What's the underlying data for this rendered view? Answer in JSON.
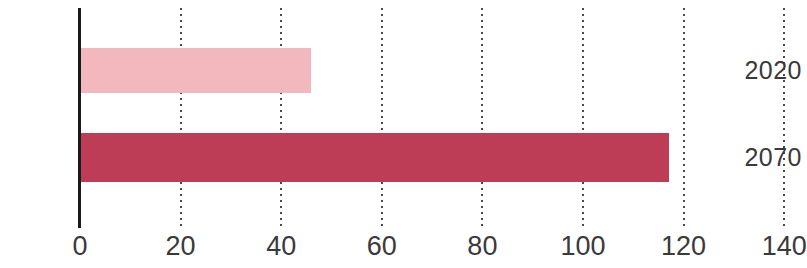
{
  "chart_data": {
    "type": "bar",
    "orientation": "horizontal",
    "title": "",
    "subtitle": "",
    "xlabel": "",
    "ylabel": "",
    "categories": [
      "2020",
      "2070"
    ],
    "values": [
      46,
      117
    ],
    "series": [
      {
        "name": "",
        "values": [
          46,
          117
        ]
      }
    ],
    "bar_colors": [
      "#F2B8BE",
      "#BC3D55"
    ],
    "xlim": [
      0,
      140
    ],
    "xticks": [
      0,
      20,
      40,
      60,
      80,
      100,
      120,
      140
    ],
    "xtick_labels": [
      "0",
      "20",
      "40",
      "60",
      "80",
      "100",
      "120",
      "140"
    ],
    "grid": "dotted-vertical",
    "axis_color": "#1a1a1a",
    "gridline_color": "#4a4a4a",
    "legend": "none",
    "annotations": []
  },
  "axis": {
    "tick_labels": [
      "0",
      "20",
      "40",
      "60",
      "80",
      "100",
      "120",
      "140"
    ]
  },
  "bars": [
    {
      "label": "2020",
      "value": 46,
      "color": "#F2B8BE"
    },
    {
      "label": "2070",
      "value": 117,
      "color": "#BC3D55"
    }
  ]
}
